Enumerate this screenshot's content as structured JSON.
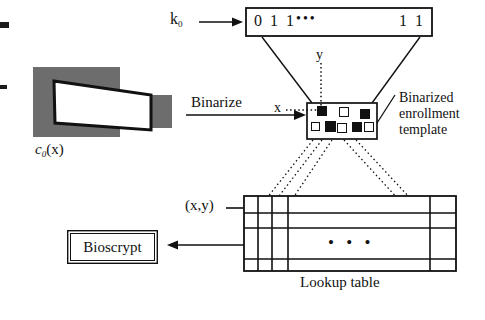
{
  "diagram": {
    "ink_color": "#111111",
    "image_gray": "#6d6d6d"
  },
  "key": {
    "label": "k",
    "subscript": "0",
    "arrow_name": "key-arrow"
  },
  "bitstring": {
    "left": "0 1 1",
    "ellipsis": "•••",
    "right": "1 1"
  },
  "source_image": {
    "caption_base": "c",
    "caption_sub": "0",
    "caption_tail": "(x)"
  },
  "binarize": {
    "label": "Binarize"
  },
  "axes": {
    "x_label": "x",
    "y_label": "y"
  },
  "template": {
    "label_line1": "Binarized",
    "label_line2": "enrollment",
    "label_line3": "template",
    "squares": [
      {
        "x": 14,
        "y": 9,
        "size": 8,
        "filled": true
      },
      {
        "x": 45,
        "y": 9,
        "size": 8,
        "filled": false
      },
      {
        "x": 75,
        "y": 12,
        "size": 8,
        "filled": true
      },
      {
        "x": 6,
        "y": 24,
        "size": 7,
        "filled": false
      },
      {
        "x": 25,
        "y": 23,
        "size": 9,
        "filled": true
      },
      {
        "x": 41,
        "y": 25,
        "size": 8,
        "filled": false
      },
      {
        "x": 63,
        "y": 24,
        "size": 8,
        "filled": true
      },
      {
        "x": 80,
        "y": 24,
        "size": 8,
        "filled": false
      }
    ]
  },
  "lookup_table": {
    "caption": "Lookup table",
    "input_label": "(x,y)",
    "ellipsis": "•  •  •"
  },
  "output": {
    "label": "Bioscrypt"
  }
}
